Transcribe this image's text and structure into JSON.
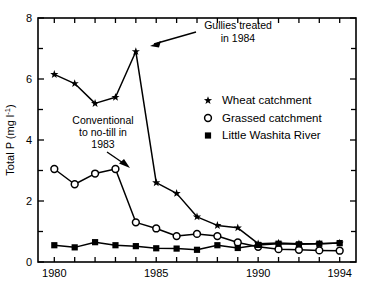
{
  "chart_data": {
    "type": "line",
    "title": "",
    "xlabel": "",
    "ylabel": "Total P (mg l-1)",
    "ylabel_main": "Total P (mg l",
    "ylabel_sup": "-1",
    "ylabel_close": ")",
    "xlim": [
      1979.2,
      1994.8
    ],
    "ylim": [
      0,
      8
    ],
    "grid": false,
    "legend_position": "center-right",
    "x": [
      1980,
      1981,
      1982,
      1983,
      1984,
      1985,
      1986,
      1987,
      1988,
      1989,
      1990,
      1991,
      1992,
      1993,
      1994
    ],
    "xticks_labeled": [
      1980,
      1985,
      1990,
      1994
    ],
    "xticks_all": [
      1980,
      1981,
      1982,
      1983,
      1984,
      1985,
      1986,
      1987,
      1988,
      1989,
      1990,
      1991,
      1992,
      1993,
      1994
    ],
    "yticks_labeled": [
      0,
      2,
      4,
      6,
      8
    ],
    "yticks_minor": [
      1,
      3,
      5,
      7
    ],
    "series": [
      {
        "name": "Wheat catchment",
        "marker": "star",
        "values": [
          6.15,
          5.85,
          5.2,
          5.4,
          6.9,
          2.6,
          2.25,
          1.48,
          1.2,
          1.12,
          0.6,
          0.62,
          0.6,
          0.6,
          0.62
        ]
      },
      {
        "name": "Grassed catchment",
        "marker": "open-circle",
        "values": [
          3.05,
          2.55,
          2.9,
          3.05,
          1.3,
          1.1,
          0.85,
          0.92,
          0.85,
          0.64,
          0.5,
          0.42,
          0.4,
          0.38,
          0.37
        ]
      },
      {
        "name": "Little Washita River",
        "marker": "filled-square",
        "values": [
          0.55,
          0.48,
          0.65,
          0.55,
          0.52,
          0.45,
          0.44,
          0.4,
          0.55,
          0.46,
          0.56,
          0.6,
          0.58,
          0.6,
          0.62
        ]
      }
    ],
    "annotations": [
      {
        "name": "gullies-annotation",
        "line1": "Gullies treated",
        "line2": "in 1984",
        "points_to_year": 1984
      },
      {
        "name": "no-till-annotation",
        "line1": "Conventional",
        "line2": "to no-till in",
        "line3": "1983",
        "points_to_year": 1983
      }
    ]
  },
  "legend": {
    "items": [
      {
        "label": "Wheat catchment",
        "marker": "star-marker"
      },
      {
        "label": "Grassed catchment",
        "marker": "open-circle-marker"
      },
      {
        "label": "Little Washita River",
        "marker": "filled-square-marker"
      }
    ]
  },
  "colors": {
    "line": "#000000",
    "background": "#ffffff",
    "axis": "#000000"
  }
}
